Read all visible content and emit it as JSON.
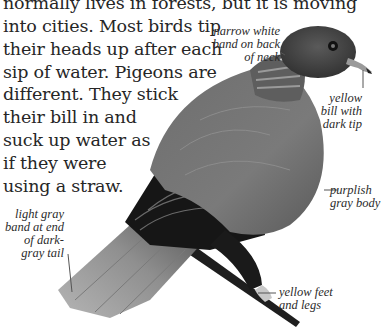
{
  "paragraph": {
    "lines": [
      "normally lives in forests, but it is moving",
      "into cities. Most birds tip",
      "their heads up after each",
      "sip of water. Pigeons are",
      "different. They stick",
      "their bill in and",
      "suck up water as",
      "if they were",
      "using a straw."
    ]
  },
  "illustration": {
    "subject": "pigeon-illustration",
    "labels": {
      "neck_band": [
        "narrow white",
        "band on back",
        "of neck"
      ],
      "bill": [
        "yellow",
        "bill with",
        "dark tip"
      ],
      "body": [
        "purplish",
        "gray body"
      ],
      "tail": [
        "light gray",
        "band at end",
        "of dark-",
        "gray tail"
      ],
      "feet": [
        "yellow feet",
        "and legs"
      ]
    }
  },
  "colors": {
    "text": "#262626",
    "label_text": "#2b2b2b",
    "background": "#ffffff",
    "leader_line": "#555555"
  }
}
